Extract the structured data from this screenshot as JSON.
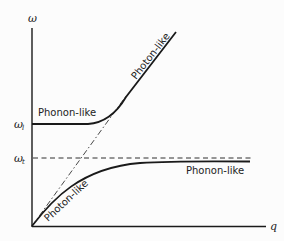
{
  "diagram": {
    "axes": {
      "y_label": "ω",
      "x_label": "q",
      "y_ticks": [
        {
          "symbol": "ω",
          "subscript": "l",
          "level": "upper"
        },
        {
          "symbol": "ω",
          "subscript": "t",
          "level": "lower"
        }
      ]
    },
    "branches": {
      "upper": {
        "low_q_label": "Phonon-like",
        "high_q_label": "Photon-like"
      },
      "lower": {
        "low_q_label": "Photon-like",
        "high_q_label": "Phonon-like"
      }
    },
    "reference_lines": [
      {
        "type": "dashed",
        "description": "photon light line ω = cq"
      },
      {
        "type": "dashed",
        "description": "horizontal line at ω_t"
      }
    ],
    "colors": {
      "line": "#1a1a1a",
      "background": "#fcfcfc"
    }
  }
}
